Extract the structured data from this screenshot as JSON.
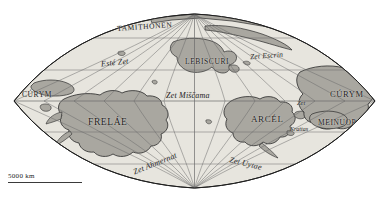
{
  "figure": {
    "name": "world-map",
    "projection": "sinusoidal",
    "background_color": "#ffffff",
    "ocean_color": "#e7e5de",
    "land_color": "#a9a7a0",
    "land_outline_color": "#2b2b2b",
    "graticule_color": "#6b6b6b",
    "border_color": "#1f1f1f",
    "label_color": "#1b1b1b"
  },
  "scalebar": {
    "label": "5000 km"
  },
  "labels": {
    "regions": [
      {
        "text": "CÚRYM",
        "x": 22,
        "y": 90,
        "size": 7.5
      },
      {
        "text": "TAMITHONEN",
        "x": 117,
        "y": 22,
        "size": 7.5
      },
      {
        "text": "LEBISCURI",
        "x": 185,
        "y": 57,
        "size": 7.5
      },
      {
        "text": "FRELÁE",
        "x": 88,
        "y": 117,
        "size": 9.5
      },
      {
        "text": "ARCÉL",
        "x": 251,
        "y": 114,
        "size": 9.0
      },
      {
        "text": "CÚRYM",
        "x": 330,
        "y": 89,
        "size": 8.5
      },
      {
        "text": "MEINUOP",
        "x": 318,
        "y": 118,
        "size": 7.5
      }
    ],
    "seas": [
      {
        "text": "Esté Zet",
        "x": 101,
        "y": 58,
        "size": 8.0,
        "rotate": -6
      },
      {
        "text": "Zet Escrin",
        "x": 250,
        "y": 51,
        "size": 7.5,
        "rotate": -4
      },
      {
        "text": "Zet Miščama",
        "x": 166,
        "y": 91,
        "size": 8.0,
        "rotate": 0
      },
      {
        "text": "Zet Ahmernat",
        "x": 132,
        "y": 159,
        "size": 8.0,
        "rotate": -22
      },
      {
        "text": "Zet Uytae",
        "x": 229,
        "y": 159,
        "size": 8.0,
        "rotate": 14
      },
      {
        "text": "Zet",
        "x": 297,
        "y": 99,
        "size": 6.5,
        "rotate": 0
      },
      {
        "text": "Krattas",
        "x": 290,
        "y": 126,
        "size": 6.0,
        "rotate": 0
      }
    ]
  },
  "graticule": {
    "equator_y": 101,
    "parallels_y": [
      38,
      70,
      101,
      132,
      164
    ],
    "meridian_count": 13,
    "center_x": 194.5
  }
}
